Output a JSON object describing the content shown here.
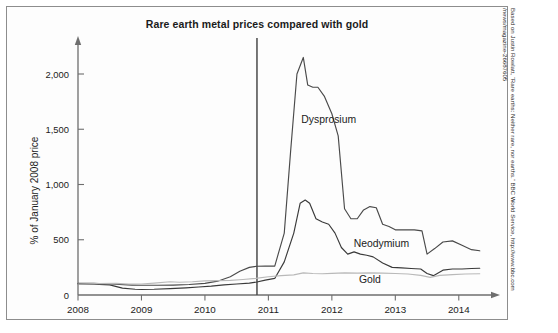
{
  "chart_data": {
    "type": "line",
    "title": "Rare earth metal prices compared with gold",
    "xlabel": "",
    "ylabel": "% of January 2008 price",
    "xlim": [
      2008,
      2014.35
    ],
    "ylim": [
      0,
      2250
    ],
    "yticks": [
      0,
      500,
      1000,
      1500,
      2000
    ],
    "ytick_labels": [
      "0",
      "500",
      "1,000",
      "1,500",
      "2,000"
    ],
    "xticks": [
      2008,
      2009,
      2010,
      2011,
      2012,
      2013,
      2014
    ],
    "xtick_labels": [
      "2008",
      "2009",
      "2010",
      "2011",
      "2012",
      "2013",
      "2014"
    ],
    "grid": false,
    "legend_position": "inline-annotations",
    "annotations": [
      {
        "label": "Dysprosium",
        "x": 2011.95,
        "y": 1560
      },
      {
        "label": "Neodymium",
        "x": 2012.78,
        "y": 430
      },
      {
        "label": "Gold",
        "x": 2012.6,
        "y": 105
      }
    ],
    "reference_line": {
      "x": 2010.82,
      "label": ""
    },
    "series": [
      {
        "name": "Dysprosium",
        "color": "#4a4a4a",
        "x": [
          2008.0,
          2008.25,
          2008.5,
          2008.65,
          2008.85,
          2009.0,
          2009.25,
          2009.5,
          2009.75,
          2010.0,
          2010.2,
          2010.4,
          2010.55,
          2010.7,
          2010.82,
          2010.95,
          2011.1,
          2011.25,
          2011.35,
          2011.45,
          2011.55,
          2011.62,
          2011.7,
          2011.78,
          2011.88,
          2012.0,
          2012.1,
          2012.2,
          2012.3,
          2012.4,
          2012.5,
          2012.6,
          2012.7,
          2012.8,
          2012.9,
          2013.0,
          2013.15,
          2013.3,
          2013.42,
          2013.5,
          2013.62,
          2013.75,
          2013.9,
          2014.05,
          2014.2,
          2014.33
        ],
        "y": [
          105,
          105,
          100,
          95,
          90,
          88,
          88,
          90,
          95,
          105,
          125,
          165,
          215,
          250,
          260,
          262,
          262,
          560,
          1300,
          2000,
          2150,
          1900,
          1880,
          1880,
          1800,
          1640,
          1440,
          780,
          690,
          690,
          770,
          800,
          790,
          640,
          620,
          590,
          590,
          590,
          580,
          370,
          420,
          480,
          490,
          450,
          410,
          400
        ]
      },
      {
        "name": "Neodymium",
        "color": "#3a3a3a",
        "x": [
          2008.0,
          2008.25,
          2008.5,
          2008.7,
          2008.9,
          2009.0,
          2009.2,
          2009.45,
          2009.7,
          2009.9,
          2010.1,
          2010.3,
          2010.5,
          2010.7,
          2010.82,
          2010.95,
          2011.1,
          2011.25,
          2011.4,
          2011.5,
          2011.58,
          2011.65,
          2011.75,
          2011.85,
          2011.95,
          2012.05,
          2012.15,
          2012.25,
          2012.35,
          2012.45,
          2012.55,
          2012.65,
          2012.8,
          2012.95,
          2013.1,
          2013.25,
          2013.4,
          2013.5,
          2013.6,
          2013.75,
          2013.9,
          2014.05,
          2014.2,
          2014.33
        ],
        "y": [
          100,
          98,
          92,
          62,
          52,
          50,
          52,
          58,
          65,
          72,
          80,
          92,
          100,
          108,
          118,
          135,
          150,
          300,
          560,
          830,
          860,
          830,
          690,
          660,
          640,
          560,
          430,
          370,
          390,
          370,
          360,
          345,
          290,
          250,
          245,
          240,
          235,
          195,
          175,
          225,
          235,
          235,
          240,
          242
        ]
      },
      {
        "name": "Gold",
        "color": "#b9b9b9",
        "x": [
          2008.0,
          2008.3,
          2008.6,
          2008.8,
          2009.0,
          2009.2,
          2009.45,
          2009.6,
          2009.8,
          2010.0,
          2010.2,
          2010.4,
          2010.6,
          2010.8,
          2011.0,
          2011.2,
          2011.4,
          2011.55,
          2011.7,
          2011.85,
          2012.0,
          2012.2,
          2012.4,
          2012.6,
          2012.8,
          2013.0,
          2013.2,
          2013.4,
          2013.55,
          2013.7,
          2013.9,
          2014.1,
          2014.33
        ],
        "y": [
          100,
          103,
          105,
          100,
          100,
          108,
          120,
          115,
          120,
          128,
          130,
          132,
          140,
          150,
          165,
          175,
          182,
          200,
          195,
          192,
          196,
          200,
          198,
          200,
          198,
          195,
          190,
          178,
          160,
          178,
          185,
          190,
          192
        ]
      }
    ]
  },
  "credit": {
    "line1": "Based on Justin Rowlatt, “Rare earths: Neither rare, nor earths.” BBC World Service, http://www.bbc.com",
    "line2": "/news/magazine-26687605"
  },
  "footer": {
    "sliver_text": ""
  }
}
